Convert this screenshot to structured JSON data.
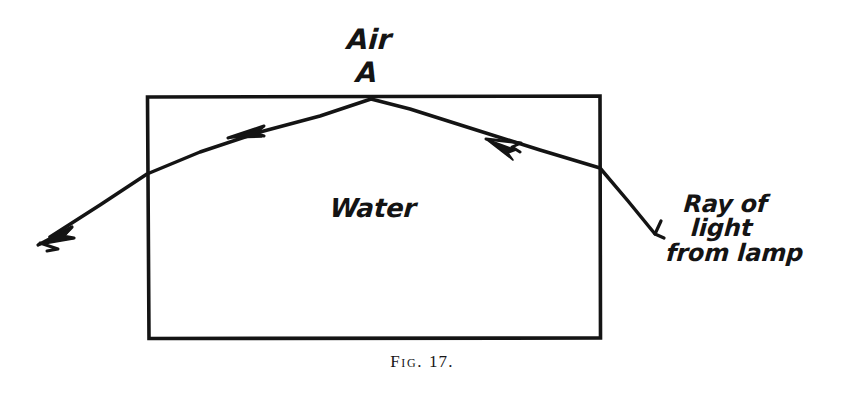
{
  "figure": {
    "caption_label": "Fig.",
    "caption_number": "17.",
    "ink_color": "#141414",
    "background_color": "#ffffff",
    "width": 844,
    "height": 396
  },
  "labels": {
    "air": "Air",
    "point_a": "A",
    "water": "Water",
    "ray_line_1": "Ray of",
    "ray_line_2": "light",
    "ray_line_3": "from lamp"
  },
  "diagram_data": {
    "type": "optics-ray-diagram",
    "subject": "reflection and refraction of a ray of light at a water surface",
    "medium_upper": "Air",
    "medium_lower": "Water",
    "tank": {
      "shape": "rectangle",
      "left": 147,
      "top": 96,
      "right": 600,
      "bottom": 338,
      "stroke_width": 3.4
    },
    "incidence_point": {
      "name": "A",
      "x": 370,
      "y": 99
    },
    "rays": [
      {
        "name": "incident-ray",
        "description": "ray of light from lamp travelling up-left toward point A",
        "points": [
          [
            655,
            235
          ],
          [
            600,
            168
          ],
          [
            370,
            99
          ]
        ],
        "arrowheads": [
          {
            "x": 505,
            "y": 147,
            "angle_deg": 197
          }
        ],
        "tail_hook": true
      },
      {
        "name": "reflected-refracted-ray",
        "description": "ray continuing down-left from A, out through the left wall",
        "points": [
          [
            370,
            99
          ],
          [
            147,
            174
          ],
          [
            45,
            240
          ]
        ],
        "arrowheads": [
          {
            "x": 250,
            "y": 133,
            "angle_deg": 198
          },
          {
            "x": 45,
            "y": 240,
            "angle_deg": 213
          }
        ]
      }
    ]
  }
}
